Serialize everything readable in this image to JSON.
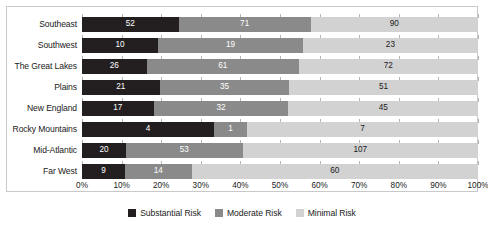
{
  "chart_data": {
    "type": "bar",
    "title": "",
    "subtitle": "",
    "xlabel": "",
    "ylabel": "",
    "orientation": "horizontal",
    "stacked": true,
    "normalized": true,
    "grid": false,
    "legend_position": "bottom",
    "xlim": [
      0,
      100
    ],
    "xtick_labels": [
      "0%",
      "10%",
      "20%",
      "30%",
      "40%",
      "50%",
      "60%",
      "70%",
      "80%",
      "90%",
      "100%"
    ],
    "xtick_values": [
      0,
      10,
      20,
      30,
      40,
      50,
      60,
      70,
      80,
      90,
      100
    ],
    "categories": [
      "Southeast",
      "Southwest",
      "The Great Lakes",
      "Plains",
      "New England",
      "Rocky Mountains",
      "Mid-Atlantic",
      "Far West"
    ],
    "series": [
      {
        "name": "Substantial Risk",
        "color": "#231f20",
        "values": [
          52,
          10,
          26,
          21,
          17,
          4,
          20,
          9
        ]
      },
      {
        "name": "Moderate Risk",
        "color": "#8a8a8a",
        "values": [
          71,
          19,
          61,
          35,
          32,
          1,
          53,
          14
        ]
      },
      {
        "name": "Minimal Risk",
        "color": "#d2d2d2",
        "values": [
          90,
          23,
          72,
          51,
          45,
          7,
          107,
          60
        ]
      }
    ],
    "row_totals": [
      213,
      52,
      159,
      107,
      94,
      12,
      180,
      83
    ]
  },
  "legend": {
    "items": [
      {
        "label": "Substantial Risk",
        "swatch": "s0"
      },
      {
        "label": "Moderate Risk",
        "swatch": "s1"
      },
      {
        "label": "Minimal Risk",
        "swatch": "s2"
      }
    ]
  }
}
